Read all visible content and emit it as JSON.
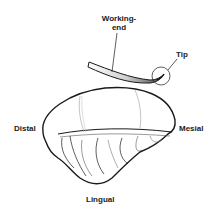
{
  "diagram": {
    "labels": {
      "working_end": "Working-\nend",
      "working_end_line1": "Working-",
      "working_end_line2": "end",
      "tip": "Tip",
      "distal": "Distal",
      "mesial": "Mesial",
      "lingual": "Lingual"
    },
    "colors": {
      "outline": "#1a1a1a",
      "instrument_light": "#e6e6e6",
      "instrument_dark": "#555555",
      "detail_lines": "#8a8a8a",
      "background": "#ffffff"
    }
  }
}
